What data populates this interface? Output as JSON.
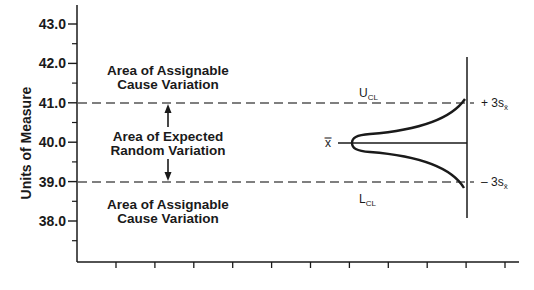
{
  "chart_data": {
    "type": "line",
    "title": "",
    "xlabel": "",
    "ylabel": "Units of Measure",
    "ylim": [
      37.0,
      43.5
    ],
    "yticks": [
      "43.0",
      "42.0",
      "41.0",
      "40.0",
      "39.0",
      "38.0"
    ],
    "yminor_ticks": [
      42.5,
      41.5,
      40.5,
      39.5,
      38.5,
      37.5
    ],
    "x_tick_count": 11,
    "x_tick_labels": [],
    "grid": false,
    "reference_lines": [
      {
        "name": "UCL",
        "label": "U",
        "subscript": "CL",
        "value": 41.0,
        "style": "dashed",
        "right_label": "+ 3s",
        "right_subscript": "x̄"
      },
      {
        "name": "center",
        "label": "x̄",
        "value": 40.0,
        "style": "solid"
      },
      {
        "name": "LCL",
        "label": "L",
        "subscript": "CL",
        "value": 39.0,
        "style": "dashed",
        "right_label": "– 3s",
        "right_subscript": "x̄"
      }
    ],
    "annotations": [
      {
        "text": "Area of Assignable Cause Variation",
        "region": "above UCL"
      },
      {
        "text": "Area of Expected Random Variation",
        "region": "between UCL and LCL"
      },
      {
        "text": "Area of Assignable Cause Variation",
        "region": "below LCL"
      }
    ],
    "distribution_curve": "normal distribution drawn sideways, peak at x̄, tails reaching ±3s"
  },
  "labels": {
    "y_axis_title": "Units of Measure",
    "upper_area_line1": "Area of Assignable",
    "upper_area_line2": "Cause Variation",
    "middle_area_line1": "Area of Expected",
    "middle_area_line2": "Random Variation",
    "lower_area_line1": "Area of Assignable",
    "lower_area_line2": "Cause Variation",
    "ucl_main": "U",
    "ucl_sub": "CL",
    "lcl_main": "L",
    "lcl_sub": "CL",
    "xbar": "x̿",
    "plus_3s": "+ 3s",
    "minus_3s": "– 3s",
    "sigma_sub": "x̄"
  },
  "colors": {
    "ink": "#1a1a1a",
    "dash": "#555555",
    "background": "#ffffff"
  }
}
